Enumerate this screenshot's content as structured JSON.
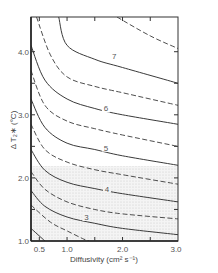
{
  "chart_data": {
    "type": "line",
    "title": "",
    "xlabel": "Diffusivity (cm² s⁻¹)",
    "ylabel": "Δ T₂∗ (°C)",
    "xlim": [
      0.35,
      3.0
    ],
    "ylim": [
      1.0,
      4.55
    ],
    "x_ticks": [
      "0.5",
      "1.0",
      "2.0",
      "3.0"
    ],
    "y_ticks": [
      "1.0",
      "2.0",
      "3.0",
      "4.0"
    ],
    "grid": false,
    "shaded_region": {
      "description": "stippled band",
      "y_range": [
        1.0,
        2.2
      ]
    },
    "series": [
      {
        "name": "2",
        "style": "solid",
        "labeled": false,
        "points": [
          [
            0.35,
            1.2
          ],
          [
            0.6,
            1.0
          ]
        ]
      },
      {
        "name": "2.5",
        "style": "dashed",
        "labeled": false,
        "points": [
          [
            0.35,
            1.57
          ],
          [
            0.7,
            1.3
          ],
          [
            1.0,
            1.16
          ],
          [
            1.3,
            1.03
          ],
          [
            1.4,
            1.0
          ]
        ]
      },
      {
        "name": "3",
        "style": "solid",
        "labeled": true,
        "points": [
          [
            0.35,
            1.8
          ],
          [
            0.6,
            1.55
          ],
          [
            1.0,
            1.38
          ],
          [
            1.5,
            1.28
          ],
          [
            2.0,
            1.2
          ],
          [
            3.0,
            1.1
          ]
        ]
      },
      {
        "name": "3.5",
        "style": "dashed",
        "labeled": false,
        "points": [
          [
            0.35,
            2.1
          ],
          [
            0.6,
            1.82
          ],
          [
            1.0,
            1.62
          ],
          [
            1.5,
            1.5
          ],
          [
            2.0,
            1.43
          ],
          [
            3.0,
            1.35
          ]
        ]
      },
      {
        "name": "4",
        "style": "solid",
        "labeled": true,
        "points": [
          [
            0.35,
            2.45
          ],
          [
            0.6,
            2.12
          ],
          [
            1.0,
            1.93
          ],
          [
            1.5,
            1.83
          ],
          [
            2.0,
            1.75
          ],
          [
            3.0,
            1.62
          ]
        ]
      },
      {
        "name": "4.5",
        "style": "dashed",
        "labeled": false,
        "points": [
          [
            0.35,
            2.85
          ],
          [
            0.6,
            2.45
          ],
          [
            1.0,
            2.25
          ],
          [
            1.5,
            2.13
          ],
          [
            2.0,
            2.05
          ],
          [
            3.0,
            1.9
          ]
        ]
      },
      {
        "name": "5",
        "style": "solid",
        "labeled": true,
        "points": [
          [
            0.35,
            3.25
          ],
          [
            0.6,
            2.8
          ],
          [
            1.0,
            2.55
          ],
          [
            1.5,
            2.45
          ],
          [
            2.0,
            2.35
          ],
          [
            3.0,
            2.2
          ]
        ]
      },
      {
        "name": "5.5",
        "style": "dashed",
        "labeled": false,
        "points": [
          [
            0.35,
            3.7
          ],
          [
            0.6,
            3.15
          ],
          [
            1.0,
            2.9
          ],
          [
            1.5,
            2.78
          ],
          [
            2.0,
            2.68
          ],
          [
            3.0,
            2.5
          ]
        ]
      },
      {
        "name": "6",
        "style": "solid",
        "labeled": true,
        "points": [
          [
            0.35,
            4.1
          ],
          [
            0.6,
            3.55
          ],
          [
            1.0,
            3.25
          ],
          [
            1.5,
            3.1
          ],
          [
            2.0,
            3.0
          ],
          [
            3.0,
            2.85
          ]
        ]
      },
      {
        "name": "6.5",
        "style": "dashed",
        "labeled": false,
        "points": [
          [
            0.45,
            4.55
          ],
          [
            0.7,
            3.95
          ],
          [
            1.0,
            3.6
          ],
          [
            1.5,
            3.45
          ],
          [
            2.0,
            3.35
          ],
          [
            3.0,
            3.15
          ]
        ]
      },
      {
        "name": "7",
        "style": "solid",
        "labeled": true,
        "points": [
          [
            0.85,
            4.55
          ],
          [
            1.0,
            4.1
          ],
          [
            1.5,
            3.88
          ],
          [
            2.0,
            3.75
          ],
          [
            3.0,
            3.5
          ]
        ]
      },
      {
        "name": "7.5",
        "style": "dashed",
        "labeled": false,
        "points": [
          [
            1.9,
            4.55
          ],
          [
            2.5,
            4.25
          ],
          [
            3.0,
            4.05
          ]
        ]
      }
    ],
    "curve_labels": [
      {
        "text": "3",
        "x": 1.35,
        "y": 1.38
      },
      {
        "text": "4",
        "x": 1.72,
        "y": 1.83
      },
      {
        "text": "5",
        "x": 1.7,
        "y": 2.48
      },
      {
        "text": "6",
        "x": 1.7,
        "y": 3.1
      },
      {
        "text": "7",
        "x": 1.85,
        "y": 3.93
      }
    ]
  }
}
